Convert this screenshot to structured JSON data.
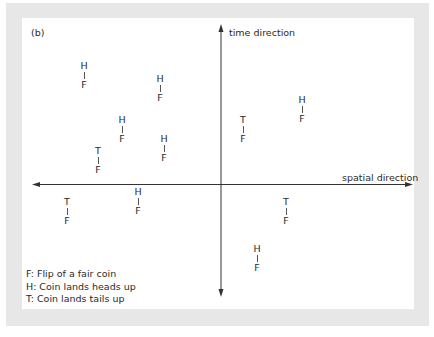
{
  "diagram": {
    "panel_label": "(b)",
    "axes": {
      "vertical_label": "time direction",
      "horizontal_label": "spatial direction"
    },
    "events": [
      {
        "top": "H",
        "bottom": "F",
        "x": 84,
        "y": 61
      },
      {
        "top": "H",
        "bottom": "F",
        "x": 160,
        "y": 74
      },
      {
        "top": "H",
        "bottom": "F",
        "x": 122,
        "y": 115
      },
      {
        "top": "H",
        "bottom": "F",
        "x": 164,
        "y": 134
      },
      {
        "top": "T",
        "bottom": "F",
        "x": 98,
        "y": 146
      },
      {
        "top": "T",
        "bottom": "F",
        "x": 243,
        "y": 115
      },
      {
        "top": "H",
        "bottom": "F",
        "x": 302,
        "y": 95
      },
      {
        "top": "H",
        "bottom": "F",
        "x": 138,
        "y": 187
      },
      {
        "top": "T",
        "bottom": "F",
        "x": 67,
        "y": 197
      },
      {
        "top": "T",
        "bottom": "F",
        "x": 286,
        "y": 197
      },
      {
        "top": "H",
        "bottom": "F",
        "x": 257,
        "y": 244
      }
    ],
    "legend": [
      "F: Flip of a fair coin",
      "H: Coin lands heads up",
      "T: Coin lands tails up"
    ],
    "colors": {
      "frame": "#e7e7e7",
      "panel": "#ffffff",
      "ink": "#2a2a2a"
    }
  }
}
